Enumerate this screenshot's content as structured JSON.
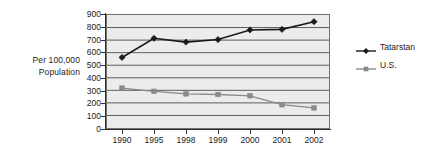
{
  "axis_title": {
    "line1": "Per 100,000",
    "line2": "Population"
  },
  "legend": {
    "position": "right",
    "entries": [
      {
        "label": "Tatarstan",
        "marker": "diamond-marker-icon",
        "color": "#1a1a1a"
      },
      {
        "label": "U.S.",
        "marker": "square-marker-icon",
        "color": "#8a8a8a"
      }
    ]
  },
  "colors": {
    "tatarstan": "#1a1a1a",
    "us": "#8a8a8a",
    "plot_background": "#ececed",
    "gridline": "#5a5a5a",
    "axis": "#2f2f2f",
    "text": "#1b1b1b"
  },
  "chart_data": {
    "type": "line",
    "title": "",
    "subtitle": "",
    "xlabel": "",
    "ylabel": "Per 100,000 Population",
    "categories": [
      "1990",
      "1995",
      "1998",
      "1999",
      "2000",
      "2001",
      "2002"
    ],
    "ylim": [
      0,
      900
    ],
    "ytick_step": 100,
    "yticks": [
      900,
      800,
      700,
      600,
      500,
      400,
      300,
      200,
      100,
      0
    ],
    "grid": true,
    "grid_axis": "y",
    "legend_position": "right",
    "series": [
      {
        "name": "Tatarstan",
        "color": "#1a1a1a",
        "marker": "diamond",
        "values": [
          560,
          710,
          680,
          700,
          775,
          780,
          840
        ]
      },
      {
        "name": "U.S.",
        "color": "#8a8a8a",
        "marker": "square",
        "values": [
          320,
          295,
          275,
          270,
          260,
          190,
          165
        ]
      }
    ]
  }
}
